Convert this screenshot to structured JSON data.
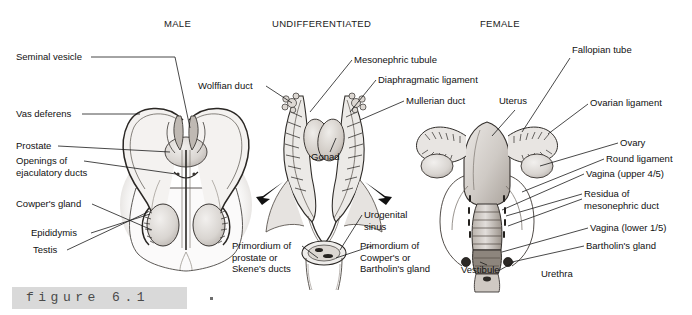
{
  "figure": {
    "caption_label": "figure 6.1",
    "caption_dot": ".",
    "panels": [
      {
        "id": "male",
        "title": "MALE"
      },
      {
        "id": "undifferentiated",
        "title": "UNDIFFERENTIATED"
      },
      {
        "id": "female",
        "title": "FEMALE"
      }
    ]
  },
  "male_labels": [
    {
      "text": "Seminal vesicle"
    },
    {
      "text": "Vas deferens"
    },
    {
      "text": "Prostate"
    },
    {
      "text": "Openings of\nejaculatory ducts"
    },
    {
      "text": "Cowper's gland"
    },
    {
      "text": "Epididymis"
    },
    {
      "text": "Testis"
    }
  ],
  "undifferentiated_labels": [
    {
      "text": "Wolffian duct"
    },
    {
      "text": "Mesonephric tubule"
    },
    {
      "text": "Diaphragmatic ligament"
    },
    {
      "text": "Mullerian duct"
    },
    {
      "text": "Gonad"
    },
    {
      "text": "Urogenital\nsinus"
    },
    {
      "text": "Primordium of\nprostate or\nSkene's ducts"
    },
    {
      "text": "Primordium of\nCowper's or\nBartholin's gland"
    }
  ],
  "female_labels": [
    {
      "text": "Fallopian tube"
    },
    {
      "text": "Uterus"
    },
    {
      "text": "Ovarian ligament"
    },
    {
      "text": "Ovary"
    },
    {
      "text": "Round ligament"
    },
    {
      "text": "Vagina (upper 4/5)"
    },
    {
      "text": "Residua of\nmesonephric duct"
    },
    {
      "text": "Vagina (lower 1/5)"
    },
    {
      "text": "Bartholin's gland"
    },
    {
      "text": "Vestibule"
    },
    {
      "text": "Urethra"
    }
  ],
  "colors": {
    "ink": "#111111",
    "leader": "#1a1a1a",
    "caption_band": "#d9d9d9",
    "caption_text": "#4a4a4a",
    "page": "#ffffff"
  }
}
